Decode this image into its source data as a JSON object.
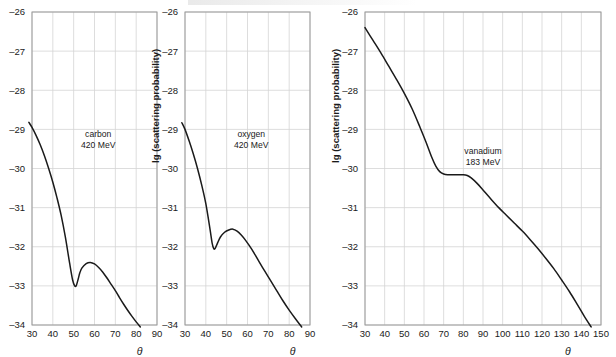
{
  "figure": {
    "axis_label_x": "θ",
    "axis_label_y": "lg (scattering probability)"
  },
  "chart_data": [
    {
      "type": "line",
      "id": "carbon",
      "title": "",
      "annotation_line1": "carbon",
      "annotation_line2": "420 MeV",
      "xlabel": "θ",
      "ylabel": "lg (scattering probability)",
      "xlim": [
        30,
        90
      ],
      "ylim": [
        -34,
        -26
      ],
      "xticks": [
        30,
        40,
        50,
        60,
        70,
        80,
        90
      ],
      "yticks": [
        -26,
        -27,
        -28,
        -29,
        -30,
        -31,
        -32,
        -33,
        -34
      ],
      "grid": true,
      "legend": "none",
      "x": [
        28.5,
        30,
        32,
        34,
        36,
        38,
        40,
        42,
        44,
        46,
        48,
        49.5,
        50.5,
        51.2,
        52,
        53,
        54,
        56,
        58,
        60,
        62,
        64,
        66,
        68,
        70,
        72,
        74,
        76,
        78,
        80,
        82
      ],
      "y": [
        -28.82,
        -28.95,
        -29.16,
        -29.4,
        -29.68,
        -30.0,
        -30.35,
        -30.75,
        -31.2,
        -31.75,
        -32.4,
        -32.85,
        -33.0,
        -33.0,
        -32.86,
        -32.66,
        -32.54,
        -32.43,
        -32.4,
        -32.44,
        -32.53,
        -32.65,
        -32.8,
        -32.96,
        -33.12,
        -33.3,
        -33.47,
        -33.63,
        -33.78,
        -33.92,
        -34.05
      ]
    },
    {
      "type": "line",
      "id": "oxygen",
      "title": "",
      "annotation_line1": "oxygen",
      "annotation_line2": "420 MeV",
      "xlabel": "θ",
      "ylabel": "lg (scattering probability)",
      "xlim": [
        30,
        90
      ],
      "ylim": [
        -34,
        -26
      ],
      "xticks": [
        30,
        40,
        50,
        60,
        70,
        80,
        90
      ],
      "yticks": [
        -26,
        -27,
        -28,
        -29,
        -30,
        -31,
        -32,
        -33,
        -34
      ],
      "grid": true,
      "legend": "none",
      "x": [
        28.5,
        30,
        32,
        34,
        36,
        38,
        40,
        42,
        43,
        43.8,
        44.5,
        45.5,
        47,
        49,
        51,
        53,
        55,
        57,
        59,
        62,
        65,
        68,
        71,
        74,
        77,
        80,
        83,
        86
      ],
      "y": [
        -28.83,
        -29.0,
        -29.3,
        -29.63,
        -30.0,
        -30.42,
        -30.9,
        -31.55,
        -31.9,
        -32.05,
        -32.04,
        -31.92,
        -31.75,
        -31.63,
        -31.57,
        -31.55,
        -31.6,
        -31.7,
        -31.83,
        -32.06,
        -32.33,
        -32.6,
        -32.86,
        -33.12,
        -33.38,
        -33.62,
        -33.84,
        -34.05
      ]
    },
    {
      "type": "line",
      "id": "vanadium",
      "title": "",
      "annotation_line1": "vanadium",
      "annotation_line2": "183 MeV",
      "xlabel": "θ",
      "ylabel": "lg (scattering probability)",
      "xlim": [
        30,
        150
      ],
      "ylim": [
        -34,
        -26
      ],
      "xticks": [
        30,
        40,
        50,
        60,
        70,
        80,
        90,
        100,
        110,
        120,
        130,
        140,
        150
      ],
      "yticks": [
        -26,
        -27,
        -28,
        -29,
        -30,
        -31,
        -32,
        -33,
        -34
      ],
      "grid": true,
      "legend": "none",
      "x": [
        30,
        34,
        38,
        42,
        46,
        50,
        54,
        58,
        61,
        64,
        66,
        68,
        70,
        72,
        76,
        80,
        82,
        84,
        87,
        90,
        94,
        98,
        102,
        106,
        110,
        114,
        118,
        122,
        126,
        130,
        134,
        138,
        142,
        145
      ],
      "y": [
        -26.4,
        -26.72,
        -27.04,
        -27.38,
        -27.72,
        -28.08,
        -28.48,
        -28.95,
        -29.32,
        -29.72,
        -29.94,
        -30.08,
        -30.14,
        -30.16,
        -30.16,
        -30.16,
        -30.18,
        -30.24,
        -30.38,
        -30.55,
        -30.78,
        -31.0,
        -31.2,
        -31.4,
        -31.6,
        -31.82,
        -32.05,
        -32.3,
        -32.56,
        -32.85,
        -33.15,
        -33.48,
        -33.82,
        -34.05
      ]
    }
  ]
}
